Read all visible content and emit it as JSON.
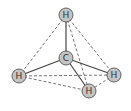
{
  "diagram": {
    "colors": {
      "atom_fill": "#c4c4c4",
      "atom_stroke": "#555555",
      "bond": "#444444",
      "edge_dashed": "#666666",
      "label": "#333333"
    },
    "atoms": [
      {
        "id": "H_top",
        "label": "H",
        "x": 66,
        "y": 15,
        "r": 7
      },
      {
        "id": "C",
        "label": "C",
        "x": 66,
        "y": 58,
        "r": 7
      },
      {
        "id": "H_left",
        "label": "H",
        "x": 19,
        "y": 76,
        "r": 7
      },
      {
        "id": "H_right",
        "label": "H",
        "x": 114,
        "y": 75,
        "r": 7
      },
      {
        "id": "H_bottom",
        "label": "H",
        "x": 89,
        "y": 91,
        "r": 7
      }
    ],
    "bonds": [
      {
        "from": "C",
        "to": "H_top",
        "style": "solid"
      },
      {
        "from": "C",
        "to": "H_left",
        "style": "solid"
      },
      {
        "from": "C",
        "to": "H_right",
        "style": "solid"
      },
      {
        "from": "C",
        "to": "H_bottom",
        "style": "solid"
      }
    ],
    "edges": [
      {
        "from": "H_top",
        "to": "H_left",
        "style": "dashed"
      },
      {
        "from": "H_top",
        "to": "H_right",
        "style": "dashed"
      },
      {
        "from": "H_top",
        "to": "H_bottom",
        "style": "dashed"
      },
      {
        "from": "H_left",
        "to": "H_right",
        "style": "dashed"
      },
      {
        "from": "H_left",
        "to": "H_bottom",
        "style": "dashed"
      },
      {
        "from": "H_right",
        "to": "H_bottom",
        "style": "dashed"
      }
    ]
  }
}
